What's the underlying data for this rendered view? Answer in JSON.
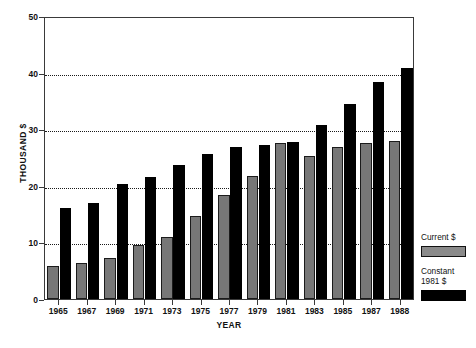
{
  "chart_data": {
    "type": "bar",
    "title": "",
    "xlabel": "YEAR",
    "ylabel": "THOUSAND $",
    "ylim": [
      0,
      50
    ],
    "yticks": [
      0,
      10,
      20,
      30,
      40,
      50
    ],
    "grid": true,
    "gridlines_at": [
      10,
      20,
      30,
      40
    ],
    "legend_position": "right",
    "categories": [
      "1965",
      "1967",
      "1969",
      "1971",
      "1973",
      "1975",
      "1977",
      "1979",
      "1981",
      "1983",
      "1985",
      "1987",
      "1988"
    ],
    "series": [
      {
        "name": "Current $",
        "color": "#777777",
        "values": [
          5.9,
          6.3,
          7.2,
          9.5,
          11.0,
          14.6,
          18.4,
          21.8,
          27.5,
          25.3,
          26.9,
          27.5,
          28.0
        ]
      },
      {
        "name": "Constant 1981 $",
        "color": "#000000",
        "values": [
          16.0,
          17.0,
          20.4,
          21.6,
          23.7,
          25.6,
          26.8,
          27.2,
          27.8,
          30.8,
          34.5,
          38.4,
          40.8
        ]
      }
    ]
  },
  "legend": {
    "entries": [
      {
        "label": "Current $",
        "swatch": "current"
      },
      {
        "label": "Constant\n1981 $",
        "swatch": "constant"
      }
    ]
  },
  "colors": {
    "current_bar": "#777777",
    "constant_bar": "#000000",
    "axis": "#3a3a3a",
    "grid": "#1a1a1a",
    "background": "#ffffff"
  }
}
